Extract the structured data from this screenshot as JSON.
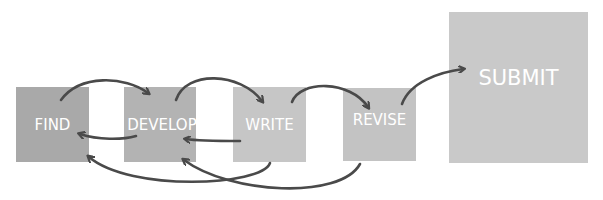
{
  "diagram": {
    "steps": [
      {
        "id": "find",
        "label": "FIND",
        "color": "#a9a9a9"
      },
      {
        "id": "develop",
        "label": "DEVELOP",
        "color": "#b3b3b3"
      },
      {
        "id": "write",
        "label": "WRITE",
        "color": "#c6c6c6"
      },
      {
        "id": "revise",
        "label": "REVISE",
        "color": "#c3c3c3"
      },
      {
        "id": "submit",
        "label": "SUBMIT",
        "color": "#c9c9c9"
      }
    ],
    "arrows": [
      {
        "from": "find",
        "to": "develop"
      },
      {
        "from": "develop",
        "to": "write"
      },
      {
        "from": "write",
        "to": "revise"
      },
      {
        "from": "revise",
        "to": "submit"
      },
      {
        "from": "develop",
        "to": "find"
      },
      {
        "from": "write",
        "to": "develop"
      },
      {
        "from": "write",
        "to": "find"
      },
      {
        "from": "revise",
        "to": "develop"
      }
    ],
    "arrow_color": "#4a4a4a"
  }
}
